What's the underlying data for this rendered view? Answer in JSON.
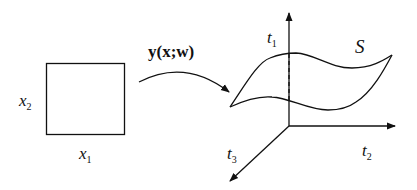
{
  "diagram": {
    "type": "mapping-diagram",
    "colors": {
      "stroke": "#111111",
      "background": "#ffffff"
    },
    "domain_square": {
      "x_axis_label": {
        "base": "x",
        "sub": "1"
      },
      "y_axis_label": {
        "base": "x",
        "sub": "2"
      }
    },
    "mapping": {
      "label": "y(x;w)"
    },
    "output_space": {
      "axes": [
        {
          "base": "t",
          "sub": "1",
          "direction": "up"
        },
        {
          "base": "t",
          "sub": "2",
          "direction": "right"
        },
        {
          "base": "t",
          "sub": "3",
          "direction": "down-left"
        }
      ],
      "surface_label": "S"
    }
  }
}
